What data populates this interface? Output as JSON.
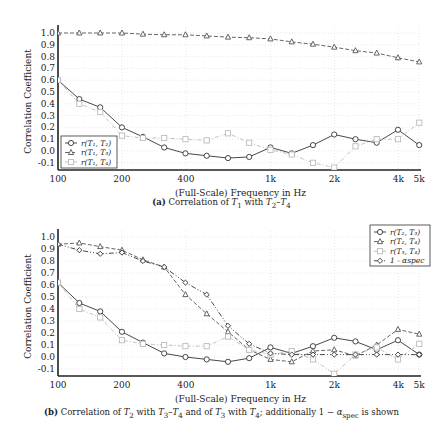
{
  "chart_data": [
    {
      "type": "line",
      "id": "a",
      "title": "",
      "caption_label": "(a)",
      "caption_text": "Correlation of T₁ with T₂–T₄",
      "xlabel": "(Full-Scale) Frequency in Hz",
      "ylabel": "Correlation Coefficient",
      "xscale": "log",
      "xlim": [
        100,
        5000
      ],
      "ylim": [
        -0.15,
        1.05
      ],
      "xticks": [
        100,
        200,
        400,
        1000,
        2000,
        4000,
        5000
      ],
      "xtick_labels": [
        "100",
        "200",
        "400",
        "1k",
        "2k",
        "4k",
        "5k"
      ],
      "yticks": [
        -0.1,
        0.0,
        0.1,
        0.2,
        0.3,
        0.4,
        0.5,
        0.6,
        0.7,
        0.8,
        0.9,
        1.0
      ],
      "ytick_labels": [
        "-0.1",
        "0.0",
        "0.1",
        "0.2",
        "0.3",
        "0.4",
        "0.5",
        "0.6",
        "0.7",
        "0.8",
        "0.9",
        "1.0"
      ],
      "grid": true,
      "legend_position": "lower left",
      "x": [
        100,
        126,
        158,
        200,
        251,
        316,
        398,
        501,
        631,
        794,
        1000,
        1259,
        1585,
        1995,
        2512,
        3162,
        3981,
        5012
      ],
      "series": [
        {
          "name": "r(T₁, T₂)",
          "marker": "circle",
          "dash": "solid",
          "color": "#333333",
          "values": [
            0.6,
            0.44,
            0.37,
            0.2,
            0.12,
            0.03,
            -0.02,
            -0.04,
            -0.06,
            -0.05,
            0.03,
            -0.02,
            0.05,
            0.14,
            0.1,
            0.07,
            0.18,
            0.05
          ]
        },
        {
          "name": "r(T₁, T₃)",
          "marker": "triangle",
          "dash": "dashed",
          "color": "#555555",
          "values": [
            1.0,
            1.0,
            1.0,
            1.0,
            0.99,
            0.985,
            0.985,
            0.975,
            0.965,
            0.96,
            0.95,
            0.925,
            0.905,
            0.88,
            0.85,
            0.83,
            0.79,
            0.755
          ]
        },
        {
          "name": "r(T₁, T₄)",
          "marker": "square",
          "dash": "dashdot",
          "color": "#bbbbbb",
          "values": [
            0.6,
            0.4,
            0.33,
            0.13,
            0.11,
            0.11,
            0.1,
            0.09,
            0.15,
            0.07,
            0.01,
            -0.03,
            -0.1,
            -0.14,
            0.04,
            0.1,
            0.1,
            0.24
          ]
        }
      ]
    },
    {
      "type": "line",
      "id": "b",
      "title": "",
      "caption_label": "(b)",
      "caption_text": "Correlation of T₂ with T₃–T₄ and of T₃ with T₄; additionally 1 − αspec is shown",
      "xlabel": "(Full-Scale) Frequency in Hz",
      "ylabel": "Correlation Coefficient",
      "xscale": "log",
      "xlim": [
        100,
        5000
      ],
      "ylim": [
        -0.15,
        1.05
      ],
      "xticks": [
        100,
        200,
        400,
        1000,
        2000,
        4000,
        5000
      ],
      "xtick_labels": [
        "100",
        "200",
        "400",
        "1k",
        "2k",
        "4k",
        "5k"
      ],
      "yticks": [
        -0.1,
        0.0,
        0.1,
        0.2,
        0.3,
        0.4,
        0.5,
        0.6,
        0.7,
        0.8,
        0.9,
        1.0
      ],
      "ytick_labels": [
        "-0.1",
        "0.0",
        "0.1",
        "0.2",
        "0.3",
        "0.4",
        "0.5",
        "0.6",
        "0.7",
        "0.8",
        "0.9",
        "1.0"
      ],
      "grid": true,
      "legend_position": "upper right",
      "x": [
        100,
        126,
        158,
        200,
        251,
        316,
        398,
        501,
        631,
        794,
        1000,
        1259,
        1585,
        1995,
        2512,
        3162,
        3981,
        5012
      ],
      "series": [
        {
          "name": "r(T₂, T₃)",
          "marker": "circle",
          "dash": "solid",
          "color": "#333333",
          "values": [
            0.62,
            0.45,
            0.38,
            0.21,
            0.12,
            0.03,
            0.0,
            -0.02,
            -0.04,
            -0.01,
            0.08,
            0.03,
            0.09,
            0.16,
            0.13,
            0.06,
            0.14,
            0.02
          ]
        },
        {
          "name": "r(T₂, T₄)",
          "marker": "triangle",
          "dash": "dashed",
          "color": "#555555",
          "values": [
            0.94,
            0.95,
            0.92,
            0.89,
            0.81,
            0.75,
            0.52,
            0.36,
            0.21,
            0.06,
            -0.02,
            -0.04,
            0.05,
            0.06,
            0.01,
            0.1,
            0.23,
            0.19
          ]
        },
        {
          "name": "r(T₃, T₄)",
          "marker": "square",
          "dash": "dashdot",
          "color": "#bbbbbb",
          "values": [
            0.62,
            0.4,
            0.33,
            0.14,
            0.11,
            0.1,
            0.09,
            0.09,
            0.17,
            0.06,
            0.02,
            0.05,
            -0.02,
            -0.14,
            0.02,
            0.08,
            -0.02,
            0.11
          ]
        },
        {
          "name": "1 - αspec",
          "marker": "diamond",
          "dash": "dashdotdot",
          "color": "#333333",
          "values": [
            0.94,
            0.89,
            0.86,
            0.87,
            0.8,
            0.75,
            0.62,
            0.52,
            0.26,
            0.11,
            0.03,
            0.02,
            0.02,
            0.02,
            0.02,
            0.02,
            0.02,
            0.02
          ]
        }
      ]
    }
  ],
  "captions": {
    "a": {
      "label": "(a)",
      "text_pre": "Correlation of ",
      "sym1": "T",
      "sub1": "1",
      "mid": " with ",
      "sym2": "T",
      "sub2": "2",
      "dash": "–",
      "sym3": "T",
      "sub3": "4"
    },
    "b": {
      "label": "(b)",
      "text_pre": "Correlation of ",
      "s1": "T",
      "b1": "2",
      "t1": " with ",
      "s2": "T",
      "b2": "3",
      "t2": "–",
      "s3": "T",
      "b3": "4",
      "t3": " and of ",
      "s4": "T",
      "b4": "3",
      "t4": " with ",
      "s5": "T",
      "b5": "4",
      "t5": "; additionally 1 − ",
      "alpha": "α",
      "alpha_sub": "spec",
      "t6": " is shown"
    }
  }
}
